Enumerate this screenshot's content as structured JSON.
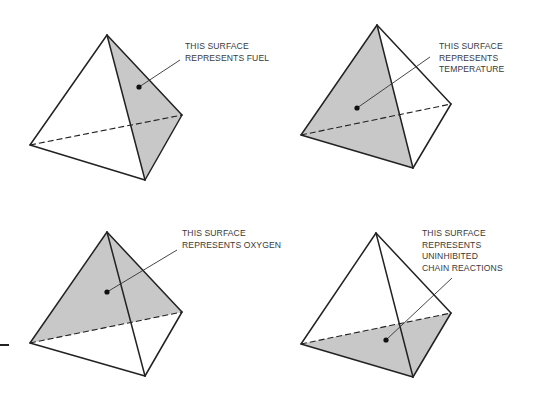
{
  "panels": [
    {
      "id": "fuel",
      "shaded_face": "right",
      "label_lines": [
        "THIS SURFACE",
        "REPRESENTS FUEL"
      ],
      "apex": [
        107,
        35
      ],
      "left": [
        30,
        145
      ],
      "bottom": [
        145,
        180
      ],
      "right": [
        182,
        115
      ],
      "dot": [
        139,
        87
      ],
      "leader_end": [
        180,
        60
      ],
      "label_pos": [
        185,
        41
      ]
    },
    {
      "id": "temperature",
      "shaded_face": "front-left",
      "label_lines": [
        "THIS SURFACE",
        "REPRESENTS",
        "TEMPERATURE"
      ],
      "apex": [
        377,
        25
      ],
      "left": [
        301,
        135
      ],
      "bottom": [
        413,
        168
      ],
      "right": [
        451,
        104
      ],
      "dot": [
        357,
        108
      ],
      "leader_end": [
        430,
        57
      ],
      "label_pos": [
        439,
        41
      ]
    },
    {
      "id": "oxygen",
      "shaded_face": "back",
      "label_lines": [
        "THIS SURFACE",
        "REPRESENTS OXYGEN"
      ],
      "apex": [
        107,
        232
      ],
      "left": [
        30,
        343
      ],
      "bottom": [
        145,
        376
      ],
      "right": [
        182,
        312
      ],
      "dot": [
        107,
        292
      ],
      "leader_end": [
        177,
        250
      ],
      "label_pos": [
        182,
        228
      ]
    },
    {
      "id": "chain-reactions",
      "shaded_face": "base",
      "label_lines": [
        "THIS SURFACE",
        "REPRESENTS",
        "UNINHIBITED",
        "CHAIN REACTIONS"
      ],
      "apex": [
        376,
        233
      ],
      "left": [
        301,
        344
      ],
      "bottom": [
        413,
        377
      ],
      "right": [
        451,
        313
      ],
      "dot": [
        386,
        340
      ],
      "leader_end": [
        452,
        278
      ],
      "label_pos": [
        422,
        228
      ]
    }
  ],
  "colors": {
    "shade": "#c8c8c8",
    "stroke": "#222222",
    "text": "#3a3a3a"
  }
}
